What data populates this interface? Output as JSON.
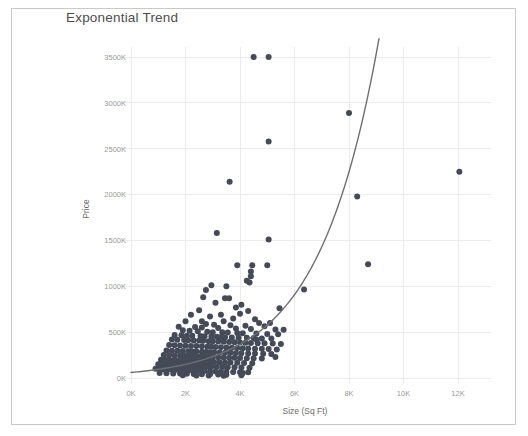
{
  "chart_title": "Exponential Trend",
  "frame": {
    "border_color": "#c9c9c9",
    "background": "#ffffff"
  },
  "colors": {
    "point": "#444a57",
    "trend_line": "#6f6f72",
    "gridline": "#ececed",
    "tick_text": "#9a9a9a",
    "axis_title": "#6b6b6b",
    "title_text": "#4d4d4d"
  },
  "chart_data": {
    "type": "scatter",
    "title": "Exponential Trend",
    "xlabel": "Size (Sq Ft)",
    "ylabel": "Price",
    "xlim": [
      0,
      13200
    ],
    "ylim": [
      0,
      3700
    ],
    "grid": true,
    "legend": "none",
    "x_tick_labels": [
      "0K",
      "2K",
      "4K",
      "6K",
      "8K",
      "10K",
      "12K"
    ],
    "x_tick_values": [
      0,
      2000,
      4000,
      6000,
      8000,
      10000,
      12000
    ],
    "y_tick_labels": [
      "0K",
      "500K",
      "1000K",
      "1500K",
      "2000K",
      "2500K",
      "3000K",
      "3500K"
    ],
    "y_tick_values": [
      0,
      500,
      1000,
      1500,
      2000,
      2500,
      3000,
      3500
    ],
    "y_unit": "thousands",
    "series": [
      {
        "name": "Homes",
        "marker": "circle",
        "marker_size": 3,
        "color": "#444a57",
        "points": [
          [
            4500,
            3500
          ],
          [
            5050,
            3500
          ],
          [
            8000,
            2890
          ],
          [
            5050,
            2580
          ],
          [
            12050,
            2250
          ],
          [
            3620,
            2140
          ],
          [
            8300,
            1980
          ],
          [
            3150,
            1580
          ],
          [
            5050,
            1510
          ],
          [
            8700,
            1240
          ],
          [
            5000,
            1230
          ],
          [
            4450,
            1230
          ],
          [
            4400,
            1160
          ],
          [
            4400,
            1110
          ],
          [
            4350,
            1040
          ],
          [
            6350,
            965
          ],
          [
            2950,
            1010
          ],
          [
            3500,
            1000
          ],
          [
            2650,
            880
          ],
          [
            3600,
            870
          ],
          [
            3100,
            820
          ],
          [
            4050,
            800
          ],
          [
            3850,
            770
          ],
          [
            2500,
            740
          ],
          [
            4300,
            730
          ],
          [
            4000,
            700
          ],
          [
            2200,
            690
          ],
          [
            3300,
            690
          ],
          [
            2900,
            670
          ],
          [
            3750,
            650
          ],
          [
            4550,
            640
          ],
          [
            2000,
            620
          ],
          [
            3400,
            620
          ],
          [
            4700,
            600
          ],
          [
            5100,
            600
          ],
          [
            2750,
            590
          ],
          [
            3050,
            580
          ],
          [
            3650,
            575
          ],
          [
            4200,
            570
          ],
          [
            4900,
            565
          ],
          [
            1750,
            560
          ],
          [
            2350,
            555
          ],
          [
            2600,
            550
          ],
          [
            3200,
            545
          ],
          [
            3850,
            540
          ],
          [
            4400,
            535
          ],
          [
            5300,
            530
          ],
          [
            5600,
            525
          ],
          [
            1900,
            520
          ],
          [
            2150,
            515
          ],
          [
            2450,
            510
          ],
          [
            2800,
            505
          ],
          [
            3000,
            500
          ],
          [
            3350,
            498
          ],
          [
            3550,
            495
          ],
          [
            3900,
            490
          ],
          [
            4100,
            488
          ],
          [
            4600,
            485
          ],
          [
            5000,
            480
          ],
          [
            5400,
            478
          ],
          [
            1600,
            470
          ],
          [
            1850,
            465
          ],
          [
            2050,
            462
          ],
          [
            2250,
            460
          ],
          [
            2550,
            458
          ],
          [
            2700,
            455
          ],
          [
            2950,
            452
          ],
          [
            3150,
            450
          ],
          [
            3300,
            448
          ],
          [
            3450,
            445
          ],
          [
            3700,
            442
          ],
          [
            3950,
            440
          ],
          [
            4250,
            438
          ],
          [
            4500,
            435
          ],
          [
            4800,
            432
          ],
          [
            5150,
            430
          ],
          [
            1500,
            420
          ],
          [
            1700,
            418
          ],
          [
            1950,
            415
          ],
          [
            2100,
            412
          ],
          [
            2300,
            410
          ],
          [
            2500,
            408
          ],
          [
            2650,
            405
          ],
          [
            2850,
            402
          ],
          [
            3000,
            400
          ],
          [
            3200,
            398
          ],
          [
            3400,
            395
          ],
          [
            3600,
            392
          ],
          [
            3800,
            390
          ],
          [
            4000,
            388
          ],
          [
            4200,
            385
          ],
          [
            4400,
            382
          ],
          [
            4650,
            380
          ],
          [
            4900,
            378
          ],
          [
            5200,
            375
          ],
          [
            5500,
            372
          ],
          [
            1400,
            360
          ],
          [
            1600,
            358
          ],
          [
            1800,
            355
          ],
          [
            2000,
            352
          ],
          [
            2200,
            350
          ],
          [
            2400,
            348
          ],
          [
            2600,
            345
          ],
          [
            2800,
            342
          ],
          [
            2950,
            340
          ],
          [
            3100,
            338
          ],
          [
            3300,
            335
          ],
          [
            3500,
            332
          ],
          [
            3700,
            330
          ],
          [
            3900,
            328
          ],
          [
            4100,
            325
          ],
          [
            4300,
            322
          ],
          [
            4550,
            320
          ],
          [
            4800,
            318
          ],
          [
            5050,
            315
          ],
          [
            5350,
            312
          ],
          [
            1300,
            300
          ],
          [
            1500,
            298
          ],
          [
            1700,
            296
          ],
          [
            1900,
            294
          ],
          [
            2100,
            292
          ],
          [
            2250,
            290
          ],
          [
            2400,
            288
          ],
          [
            2600,
            286
          ],
          [
            2750,
            284
          ],
          [
            2900,
            282
          ],
          [
            3050,
            280
          ],
          [
            3250,
            278
          ],
          [
            3450,
            276
          ],
          [
            3650,
            274
          ],
          [
            3850,
            272
          ],
          [
            4050,
            270
          ],
          [
            4300,
            268
          ],
          [
            4550,
            266
          ],
          [
            4850,
            264
          ],
          [
            5150,
            262
          ],
          [
            1200,
            250
          ],
          [
            1400,
            248
          ],
          [
            1600,
            246
          ],
          [
            1800,
            244
          ],
          [
            1950,
            242
          ],
          [
            2100,
            240
          ],
          [
            2250,
            238
          ],
          [
            2400,
            236
          ],
          [
            2550,
            234
          ],
          [
            2700,
            232
          ],
          [
            2850,
            230
          ],
          [
            3000,
            228
          ],
          [
            3200,
            226
          ],
          [
            3400,
            224
          ],
          [
            3600,
            222
          ],
          [
            3800,
            220
          ],
          [
            4000,
            218
          ],
          [
            4250,
            216
          ],
          [
            4500,
            214
          ],
          [
            4800,
            212
          ],
          [
            1100,
            200
          ],
          [
            1250,
            198
          ],
          [
            1400,
            196
          ],
          [
            1550,
            194
          ],
          [
            1700,
            192
          ],
          [
            1850,
            190
          ],
          [
            2000,
            188
          ],
          [
            2150,
            186
          ],
          [
            2300,
            184
          ],
          [
            2450,
            182
          ],
          [
            2600,
            180
          ],
          [
            2750,
            178
          ],
          [
            2900,
            176
          ],
          [
            3050,
            174
          ],
          [
            3250,
            172
          ],
          [
            3450,
            170
          ],
          [
            3650,
            168
          ],
          [
            3900,
            166
          ],
          [
            4150,
            164
          ],
          [
            4450,
            162
          ],
          [
            1000,
            150
          ],
          [
            1150,
            148
          ],
          [
            1300,
            146
          ],
          [
            1450,
            144
          ],
          [
            1600,
            142
          ],
          [
            1750,
            140
          ],
          [
            1900,
            138
          ],
          [
            2050,
            136
          ],
          [
            2200,
            134
          ],
          [
            2350,
            132
          ],
          [
            2500,
            130
          ],
          [
            2650,
            128
          ],
          [
            2800,
            126
          ],
          [
            2950,
            124
          ],
          [
            3150,
            122
          ],
          [
            3350,
            120
          ],
          [
            3550,
            118
          ],
          [
            3800,
            116
          ],
          [
            4050,
            114
          ],
          [
            4350,
            112
          ],
          [
            900,
            100
          ],
          [
            1050,
            98
          ],
          [
            1200,
            96
          ],
          [
            1350,
            94
          ],
          [
            1500,
            92
          ],
          [
            1650,
            90
          ],
          [
            1800,
            88
          ],
          [
            1950,
            86
          ],
          [
            2100,
            84
          ],
          [
            2250,
            82
          ],
          [
            2400,
            80
          ],
          [
            2550,
            78
          ],
          [
            2700,
            76
          ],
          [
            2900,
            74
          ],
          [
            3100,
            72
          ],
          [
            3300,
            70
          ],
          [
            3500,
            68
          ],
          [
            3750,
            66
          ],
          [
            4000,
            64
          ],
          [
            4300,
            62
          ],
          [
            1050,
            55
          ],
          [
            1300,
            52
          ],
          [
            1550,
            50
          ],
          [
            1800,
            48
          ],
          [
            2050,
            46
          ],
          [
            2300,
            44
          ],
          [
            2600,
            42
          ],
          [
            2900,
            40
          ],
          [
            3200,
            38
          ],
          [
            3500,
            36
          ],
          [
            1900,
            30
          ],
          [
            2400,
            28
          ],
          [
            2850,
            26
          ],
          [
            3400,
            24
          ],
          [
            4100,
            55
          ],
          [
            4600,
            420
          ],
          [
            5300,
            230
          ],
          [
            4050,
            30
          ],
          [
            2750,
            960
          ],
          [
            3900,
            1230
          ],
          [
            3450,
            870
          ],
          [
            4250,
            1060
          ],
          [
            2600,
            620
          ],
          [
            5450,
            760
          ]
        ]
      }
    ],
    "trend": {
      "name": "Exponential trend line",
      "type": "exponential",
      "color": "#6f6f72",
      "x_start": 0,
      "x_end": 9100,
      "description": "Exponential fit rising from about 60K at 0 Sq Ft to about 3700K near 9.1K Sq Ft"
    }
  }
}
